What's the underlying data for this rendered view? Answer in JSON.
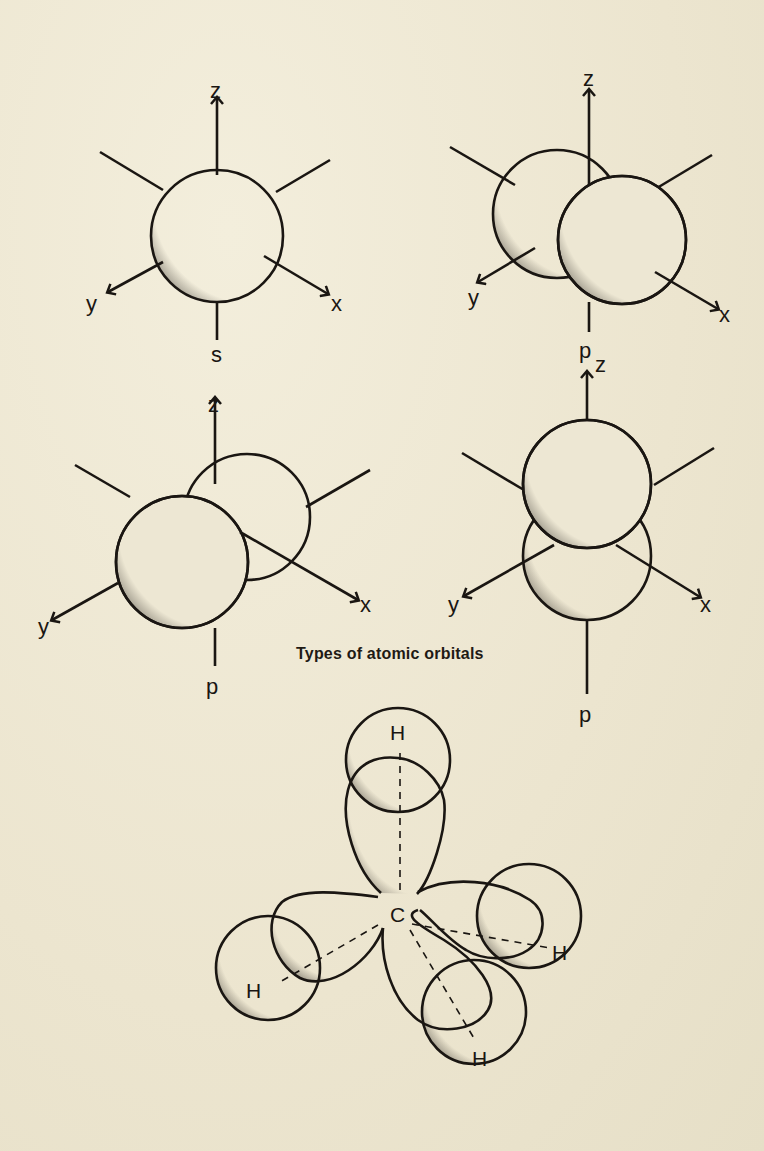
{
  "caption": "Types of atomic orbitals",
  "orbitals": [
    {
      "name": "s-orbital",
      "axis_labels": {
        "z": "z",
        "y": "y",
        "x": "x"
      },
      "orbital_label": "s"
    },
    {
      "name": "p-orbital-x",
      "axis_labels": {
        "z": "z",
        "y": "y",
        "x": "x"
      },
      "orbital_label": "p"
    },
    {
      "name": "p-orbital-y",
      "axis_labels": {
        "z": "z",
        "y": "y",
        "x": "x"
      },
      "orbital_label": "p"
    },
    {
      "name": "p-orbital-z",
      "axis_labels": {
        "z": "z",
        "y": "y",
        "x": "x"
      },
      "orbital_label": "p"
    }
  ],
  "methane": {
    "center_atom": "C",
    "outer_atoms": [
      "H",
      "H",
      "H",
      "H"
    ]
  },
  "colors": {
    "paper": "#efe9d6",
    "ink": "#1a1612"
  }
}
